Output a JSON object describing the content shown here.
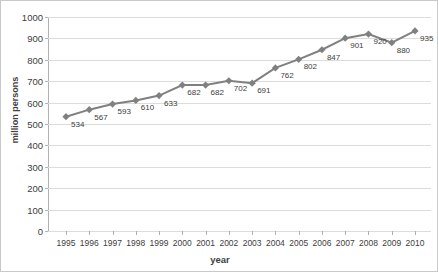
{
  "chart_data": {
    "type": "line",
    "title": "",
    "xlabel": "year",
    "ylabel": "million persons",
    "categories": [
      "1995",
      "1996",
      "1997",
      "1998",
      "1999",
      "2000",
      "2001",
      "2002",
      "2003",
      "2004",
      "2005",
      "2006",
      "2007",
      "2008",
      "2009",
      "2010"
    ],
    "values": [
      534,
      567,
      593,
      610,
      633,
      682,
      682,
      702,
      691,
      762,
      802,
      847,
      901,
      920,
      880,
      935
    ],
    "data_labels": [
      "534",
      "567",
      "593",
      "610",
      "633",
      "682",
      "682",
      "702",
      "691",
      "762",
      "802",
      "847",
      "901",
      "920",
      "880",
      "935"
    ],
    "ylim": [
      0,
      1000
    ],
    "yticks": [
      "0",
      "100",
      "200",
      "300",
      "400",
      "500",
      "600",
      "700",
      "800",
      "900",
      "1000"
    ],
    "ytick_values": [
      0,
      100,
      200,
      300,
      400,
      500,
      600,
      700,
      800,
      900,
      1000
    ],
    "grid": true,
    "legend": "none",
    "series_color": "#808080",
    "marker": "diamond",
    "grid_color": "#dcdcdc",
    "axis_color": "#b0b0b0",
    "text_color": "#404040"
  }
}
